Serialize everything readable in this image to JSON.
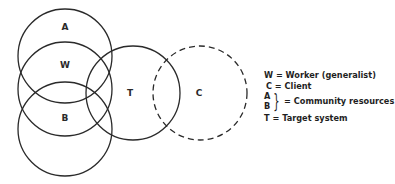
{
  "diagram": {
    "circles": [
      {
        "id": "A",
        "label": "A",
        "style": "solid"
      },
      {
        "id": "W",
        "label": "W",
        "style": "solid"
      },
      {
        "id": "B",
        "label": "B",
        "style": "solid"
      },
      {
        "id": "T",
        "label": "T",
        "style": "solid"
      },
      {
        "id": "C",
        "label": "C",
        "style": "dashed"
      }
    ],
    "stroke_color": "#2a2a2a"
  },
  "legend": {
    "worker": "W = Worker (generalist)",
    "client": "C = Client",
    "community_a": "A",
    "community_b": "B",
    "community_label": "= Community resources",
    "target": "T = Target system"
  }
}
